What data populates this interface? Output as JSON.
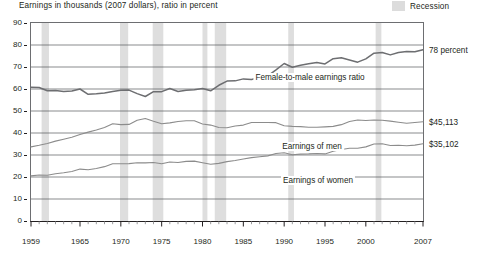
{
  "chart_data": {
    "type": "line",
    "title": "Earnings in thousands (2007 dollars), ratio in percent",
    "xlabel": "",
    "ylabel": "",
    "xlim": [
      1959,
      2007
    ],
    "ylim": [
      0,
      90
    ],
    "ytick_values": [
      0,
      10,
      20,
      30,
      40,
      50,
      60,
      70,
      80,
      90
    ],
    "ytick_labels": [
      "0",
      "10",
      "20",
      "30",
      "40",
      "50",
      "60",
      "70",
      "80",
      "90"
    ],
    "xtick_values": [
      1959,
      1965,
      1970,
      1975,
      1980,
      1985,
      1990,
      1995,
      2000,
      2007
    ],
    "xtick_labels": [
      "1959",
      "1965",
      "1970",
      "1975",
      "1980",
      "1985",
      "1990",
      "1995",
      "2000",
      "2007"
    ],
    "grid": "horizontal",
    "legend_position": "top-right",
    "legend": [
      {
        "label": "Recession",
        "color": "#dcdcdc",
        "kind": "band"
      }
    ],
    "x": [
      1959,
      1960,
      1961,
      1962,
      1963,
      1964,
      1965,
      1966,
      1967,
      1968,
      1969,
      1970,
      1971,
      1972,
      1973,
      1974,
      1975,
      1976,
      1977,
      1978,
      1979,
      1980,
      1981,
      1982,
      1983,
      1984,
      1985,
      1986,
      1987,
      1988,
      1989,
      1990,
      1991,
      1992,
      1993,
      1994,
      1995,
      1996,
      1997,
      1998,
      1999,
      2000,
      2001,
      2002,
      2003,
      2004,
      2005,
      2006,
      2007
    ],
    "series": [
      {
        "name": "Female-to-male earnings ratio",
        "unit": "percent",
        "color": "#6d6e71",
        "end_label": "78 percent",
        "values": [
          60.8,
          60.7,
          59.2,
          59.3,
          58.9,
          59.1,
          60.0,
          57.6,
          57.8,
          58.2,
          58.9,
          59.4,
          59.5,
          57.9,
          56.6,
          58.8,
          58.8,
          60.2,
          58.9,
          59.4,
          59.7,
          60.2,
          59.2,
          61.7,
          63.6,
          63.7,
          64.6,
          64.3,
          65.2,
          66.0,
          68.7,
          71.6,
          69.9,
          70.8,
          71.5,
          72.0,
          71.4,
          73.8,
          74.2,
          73.2,
          72.2,
          73.7,
          76.3,
          76.6,
          75.5,
          76.6,
          77.0,
          76.9,
          77.8
        ]
      },
      {
        "name": "Earnings of men",
        "unit": "thousands of 2007 dollars",
        "color": "#8c8c8c",
        "end_label": "$45,113",
        "values": [
          33.7,
          34.4,
          35.2,
          36.3,
          37.2,
          38.1,
          39.3,
          40.4,
          41.4,
          42.5,
          44.2,
          43.8,
          43.9,
          45.8,
          46.6,
          45.3,
          44.2,
          44.6,
          45.2,
          45.6,
          45.6,
          44.1,
          43.6,
          42.5,
          42.4,
          43.2,
          43.6,
          44.8,
          44.8,
          44.8,
          44.7,
          43.3,
          43.0,
          42.9,
          42.6,
          42.6,
          42.8,
          43.0,
          43.8,
          45.2,
          45.9,
          45.7,
          45.9,
          45.8,
          45.4,
          44.9,
          44.4,
          44.8,
          45.1
        ]
      },
      {
        "name": "Earnings of women",
        "unit": "thousands of 2007 dollars",
        "color": "#8c8c8c",
        "end_label": "$35,102",
        "values": [
          20.5,
          20.9,
          20.8,
          21.5,
          21.9,
          22.5,
          23.6,
          23.3,
          23.9,
          24.7,
          26.0,
          26.0,
          26.1,
          26.5,
          26.4,
          26.6,
          26.0,
          26.8,
          26.6,
          27.1,
          27.2,
          26.5,
          25.8,
          26.2,
          27.0,
          27.5,
          28.2,
          28.8,
          29.2,
          29.6,
          30.7,
          31.0,
          30.1,
          30.4,
          30.5,
          30.7,
          30.5,
          31.7,
          32.5,
          33.1,
          33.1,
          33.7,
          35.0,
          35.1,
          34.3,
          34.4,
          34.2,
          34.5,
          35.1
        ]
      }
    ],
    "recession_bands": [
      {
        "start": 1960.3,
        "end": 1961.2
      },
      {
        "start": 1969.9,
        "end": 1970.9
      },
      {
        "start": 1973.9,
        "end": 1975.2
      },
      {
        "start": 1980.0,
        "end": 1980.6
      },
      {
        "start": 1981.5,
        "end": 1982.9
      },
      {
        "start": 1990.5,
        "end": 1991.2
      },
      {
        "start": 2001.2,
        "end": 2001.9
      }
    ]
  }
}
